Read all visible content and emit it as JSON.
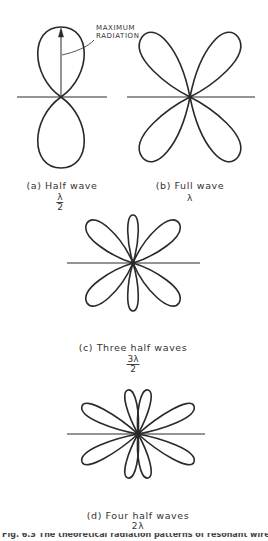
{
  "figure": {
    "annotation": [
      "MAXIMUM",
      "RADIATION"
    ],
    "panels": [
      {
        "id": "a",
        "label": "(a) Half wave",
        "value_num": "λ",
        "value_den": "2",
        "lobes_per_half": 1,
        "center": [
          61,
          97
        ]
      },
      {
        "id": "b",
        "label": "(b) Full wave",
        "value": "λ",
        "lobes_per_half": 2,
        "center": [
          190,
          97
        ]
      },
      {
        "id": "c",
        "label": "(c) Three half waves",
        "value_num": "3λ",
        "value_den": "2",
        "lobes_per_half": 3,
        "center": [
          133,
          263
        ]
      },
      {
        "id": "d",
        "label": "(d) Four half waves",
        "value": "2λ",
        "lobes_per_half": 4,
        "center": [
          138,
          434
        ]
      }
    ],
    "caption": "Fig. 6.3 The theoretical radiation patterns of resonant wires"
  },
  "colors": {
    "line": "#2a2a2a",
    "background": "#ffffff"
  }
}
